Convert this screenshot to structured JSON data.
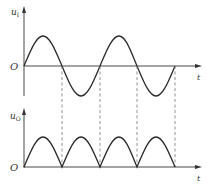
{
  "diagram": {
    "colors": {
      "axis": "#333333",
      "curve": "#2a2a2a",
      "dashed": "#777777",
      "background": "#ffffff"
    },
    "top_plot": {
      "y_label_main": "u",
      "y_label_sub": "I",
      "origin_label": "O",
      "x_label": "t",
      "waveform": "sine",
      "cycles": 2
    },
    "bottom_plot": {
      "y_label_main": "u",
      "y_label_sub": "O",
      "origin_label": "O",
      "x_label": "t",
      "waveform": "full-wave rectified sine",
      "humps": 4
    },
    "dashed_guides": 4
  }
}
